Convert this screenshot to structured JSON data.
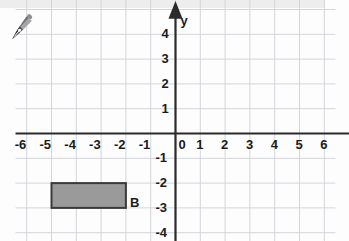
{
  "figure": {
    "kind": "coordinate-plane",
    "background_color": "#fdfdfd",
    "top_band_color": "#ededee"
  },
  "icons": {
    "pen_nib": "pen-nib-icon"
  },
  "axes": {
    "x_letter": "x",
    "y_letter": "y",
    "axis_color": "#2b2b2b",
    "grid_color": "#d3d5da",
    "origin_label": "0",
    "x_ticks": [
      "-6",
      "-5",
      "-4",
      "-3",
      "-2",
      "-1",
      "0",
      "1",
      "2",
      "3",
      "4",
      "5",
      "6"
    ],
    "y_ticks": [
      "4",
      "3",
      "2",
      "1",
      "-1",
      "-2",
      "-3",
      "-4"
    ],
    "xlim": [
      -6,
      6
    ],
    "ylim": [
      -4,
      4
    ]
  },
  "shapes": [
    {
      "label": "B",
      "type": "rectangle",
      "fill_color": "#9a9a9a",
      "stroke_color": "#3a3a3a",
      "x_min": -5,
      "x_max": -2,
      "y_min": -3,
      "y_max": -2,
      "width_units": 3,
      "height_units": 1
    }
  ],
  "chart_data": {
    "type": "scatter",
    "title": "",
    "xlabel": "x",
    "ylabel": "y",
    "x": [
      -5,
      -2,
      -2,
      -5
    ],
    "y": [
      -2,
      -2,
      -3,
      -3
    ],
    "xlim": [
      -6,
      6
    ],
    "ylim": [
      -4,
      4
    ],
    "grid": true,
    "legend": "none",
    "annotations": [
      {
        "text": "B",
        "x": -2,
        "y": -3
      }
    ]
  }
}
